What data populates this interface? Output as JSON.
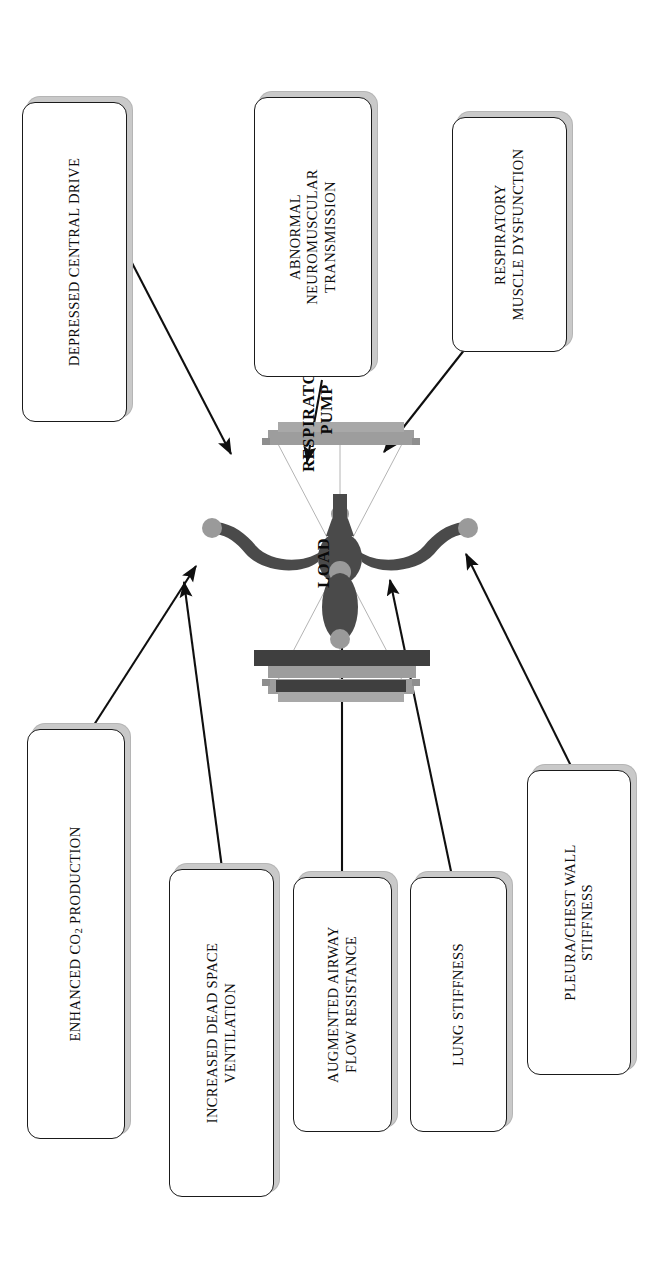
{
  "figure": {
    "type": "balance-scale-diagram",
    "orientation": "rotated-90-ccw",
    "background_color": "#ffffff",
    "line_color": "#1a1a1a",
    "shadow_color": "#c9c9c9",
    "scale_dark_color": "#474747",
    "scale_pan_color": "#9a9a9a"
  },
  "center": {
    "load_label": "LOAD",
    "pump_label": "RESPIRATORY\nPUMP"
  },
  "load_factors": [
    {
      "id": "co2",
      "label": "ENHANCED CO2 PRODUCTION",
      "label_html": "ENHANCED CO<sub>2</sub> PRODUCTION"
    },
    {
      "id": "deadspace",
      "label": "INCREASED  DEAD  SPACE\nVENTILATION"
    },
    {
      "id": "airway",
      "label": "AUGMENTED AIRWAY\nFLOW RESISTANCE"
    },
    {
      "id": "lungstiff",
      "label": "LUNG STIFFNESS"
    },
    {
      "id": "pleura",
      "label": "PLEURA/CHEST WALL\nSTIFFNESS"
    }
  ],
  "pump_factors": [
    {
      "id": "drive",
      "label": "DEPRESSED CENTRAL DRIVE"
    },
    {
      "id": "neuro",
      "label": "ABNORMAL\nNEUROMUSCULAR\nTRANSMISSION"
    },
    {
      "id": "muscle",
      "label": "RESPIRATORY\nMUSCLE DYSFUNCTION"
    }
  ],
  "arrows": [
    {
      "id": "co2-to-load",
      "from": "ENHANCED CO2 PRODUCTION",
      "to": "LOAD"
    },
    {
      "id": "deadspace-to-load",
      "from": "INCREASED DEAD SPACE VENTILATION",
      "to": "LOAD"
    },
    {
      "id": "airway-to-load",
      "from": "AUGMENTED AIRWAY FLOW RESISTANCE",
      "to": "LOAD"
    },
    {
      "id": "lungstiff-to-load",
      "from": "LUNG STIFFNESS",
      "to": "LOAD"
    },
    {
      "id": "pleura-to-load",
      "from": "PLEURA/CHEST WALL STIFFNESS",
      "to": "LOAD"
    },
    {
      "id": "drive-to-pump",
      "from": "DEPRESSED CENTRAL DRIVE",
      "to": "RESPIRATORY PUMP"
    },
    {
      "id": "neuro-to-pump",
      "from": "ABNORMAL NEUROMUSCULAR TRANSMISSION",
      "to": "RESPIRATORY PUMP"
    },
    {
      "id": "muscle-to-pump",
      "from": "RESPIRATORY MUSCLE DYSFUNCTION",
      "to": "RESPIRATORY PUMP"
    }
  ]
}
